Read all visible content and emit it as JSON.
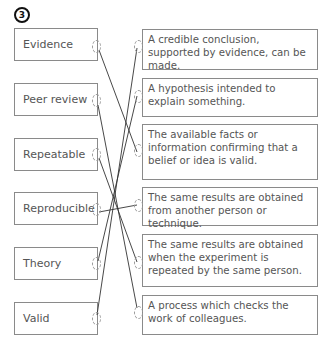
{
  "question_number": "3",
  "terms": [
    {
      "label": "Evidence"
    },
    {
      "label": "Peer review"
    },
    {
      "label": "Repeatable"
    },
    {
      "label": "Reproducible"
    },
    {
      "label": "Theory"
    },
    {
      "label": "Valid"
    }
  ],
  "definitions": [
    {
      "text": "A credible conclusion, supported by evidence, can be made."
    },
    {
      "text": "A hypothesis intended to explain something."
    },
    {
      "text": "The available facts or information confirming that a belief or idea is valid."
    },
    {
      "text": "The same results are obtained from another person or technique."
    },
    {
      "text": "The same results are obtained when the experiment is repeated by the same person."
    },
    {
      "text": "A process which checks the work of colleagues."
    }
  ],
  "matches": [
    {
      "term": "Evidence",
      "definition_index": 2
    },
    {
      "term": "Peer review",
      "definition_index": 5
    },
    {
      "term": "Repeatable",
      "definition_index": 4
    },
    {
      "term": "Reproducible",
      "definition_index": 3
    },
    {
      "term": "Theory",
      "definition_index": 1
    },
    {
      "term": "Valid",
      "definition_index": 0
    }
  ],
  "colors": {
    "box_border": "#8a8a8a",
    "text": "#555555",
    "line": "#333333"
  }
}
